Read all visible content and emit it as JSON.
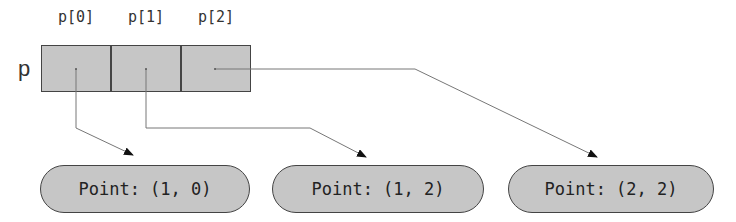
{
  "variable": {
    "name": "p"
  },
  "array": {
    "cells": [
      {
        "label": "p[0]"
      },
      {
        "label": "p[1]"
      },
      {
        "label": "p[2]"
      }
    ]
  },
  "objects": [
    {
      "label": "Point: (1, 0)"
    },
    {
      "label": "Point: (1, 2)"
    },
    {
      "label": "Point: (2, 2)"
    }
  ],
  "colors": {
    "fill": "#c6c6c6",
    "border": "#444444",
    "line": "#777777",
    "arrowhead": "#111111"
  }
}
